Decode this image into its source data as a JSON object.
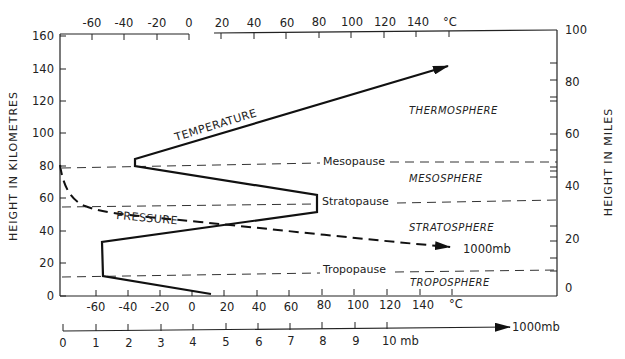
{
  "diagram": {
    "left_axis": {
      "title": "HEIGHT IN KILOMETRES",
      "ticks": [
        "0",
        "20",
        "40",
        "60",
        "80",
        "100",
        "120",
        "140",
        "160"
      ]
    },
    "right_axis": {
      "title": "HEIGHT IN MILES",
      "ticks": [
        "0",
        "20",
        "40",
        "60",
        "80",
        "100"
      ]
    },
    "top_axis": {
      "ticks": [
        "-60",
        "-40",
        "-20",
        "0",
        "20",
        "40",
        "60",
        "80",
        "100",
        "120",
        "140"
      ],
      "unit": "°C"
    },
    "bottom_temp_axis": {
      "ticks": [
        "-60",
        "-40",
        "-20",
        "0",
        "20",
        "40",
        "60",
        "80",
        "100",
        "120",
        "140"
      ],
      "unit": "°C"
    },
    "pressure_axis": {
      "ticks": [
        "0",
        "1",
        "2",
        "3",
        "4",
        "5",
        "6",
        "7",
        "8",
        "9",
        "10 mb"
      ],
      "end_label": "1000mb"
    },
    "curves": {
      "temperature_label": "TEMPERATURE",
      "pressure_label": "PRESSURE",
      "pressure_end_label": "1000mb"
    },
    "boundaries": {
      "mesopause": "Mesopause",
      "stratopause": "Stratopause",
      "tropopause": "Tropopause"
    },
    "layers": {
      "thermosphere": "THERMOSPHERE",
      "mesosphere": "MESOSPHERE",
      "stratosphere": "STRATOSPHERE",
      "troposphere": "TROPOSPHERE"
    },
    "temperature_profile": [
      {
        "temp_c": 10,
        "height_km": 0
      },
      {
        "temp_c": -57,
        "height_km": 12
      },
      {
        "temp_c": -57,
        "height_km": 33
      },
      {
        "temp_c": 78,
        "height_km": 55
      },
      {
        "temp_c": 78,
        "height_km": 64
      },
      {
        "temp_c": -38,
        "height_km": 80
      },
      {
        "temp_c": -38,
        "height_km": 85
      },
      {
        "temp_c": 148,
        "height_km": 142
      }
    ],
    "boundary_heights_km": {
      "tropopause": 12,
      "stratopause": 55,
      "mesopause": 81
    }
  }
}
